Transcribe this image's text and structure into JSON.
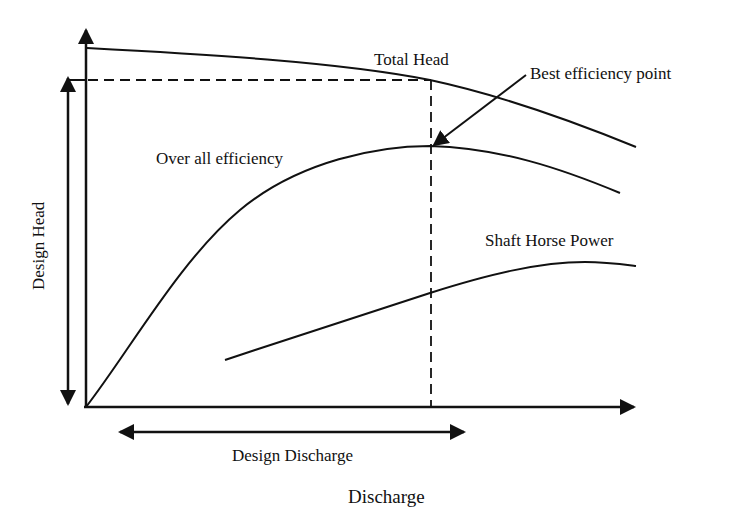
{
  "diagram": {
    "title": "",
    "type": "pump characteristic curves",
    "colors": {
      "line": "#111111",
      "background": "#ffffff"
    },
    "axes": {
      "x_label": "Discharge",
      "y_label": "Design Head"
    },
    "curves": [
      {
        "name": "Total Head",
        "label": "Total Head"
      },
      {
        "name": "Over all efficiency",
        "label": "Over all efficiency"
      },
      {
        "name": "Shaft Horse Power",
        "label": "Shaft Horse Power"
      }
    ],
    "annotations": {
      "best_efficiency_point": "Best efficiency point",
      "design_discharge": "Design Discharge",
      "design_head": "Design Head"
    }
  }
}
